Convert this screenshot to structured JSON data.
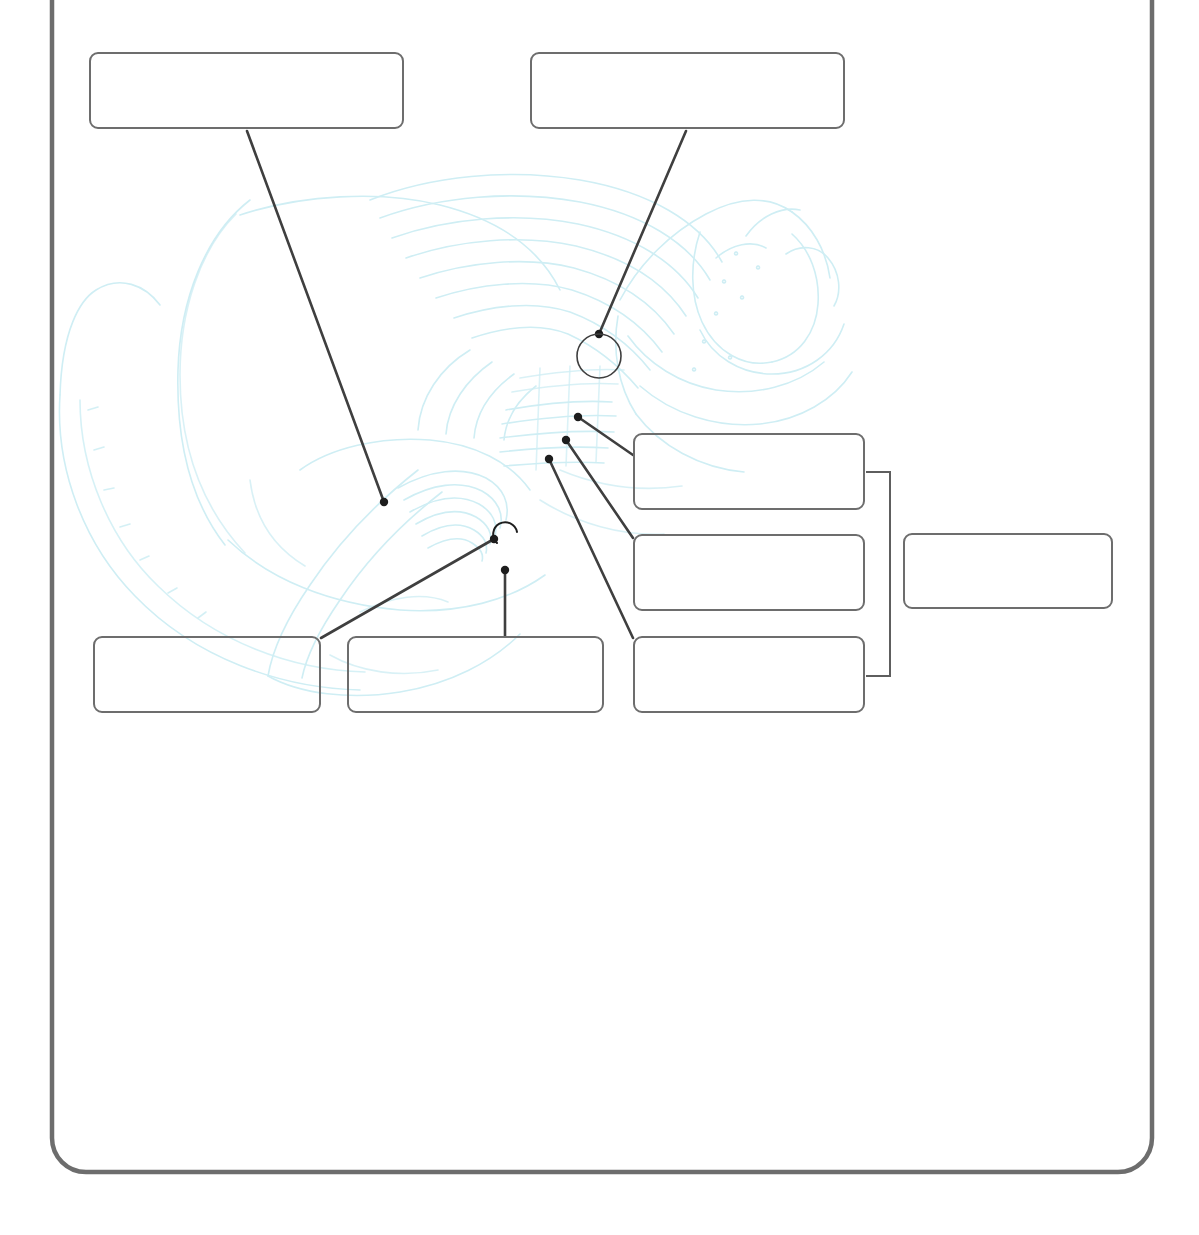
{
  "worksheet": {
    "title": "Anatomy Labeling Worksheet",
    "frame": {
      "name": "page-frame",
      "stroke_color": "#6d6d6d",
      "corner_radius": 34,
      "x": 52,
      "y": -60,
      "width": 1100,
      "height": 1232
    },
    "illustration": {
      "name": "anatomical-line-art",
      "description": "faint cyan anatomical line drawing",
      "stroke_color": "#cdeef2"
    },
    "label_boxes": [
      {
        "id": "box-1",
        "label": "",
        "placeholder": "",
        "x": 89,
        "y": 52,
        "width": 315,
        "height": 77
      },
      {
        "id": "box-2",
        "label": "",
        "placeholder": "",
        "x": 530,
        "y": 52,
        "width": 315,
        "height": 77
      },
      {
        "id": "box-3",
        "label": "",
        "placeholder": "",
        "x": 633,
        "y": 433,
        "width": 232,
        "height": 77
      },
      {
        "id": "box-4",
        "label": "",
        "placeholder": "",
        "x": 633,
        "y": 534,
        "width": 232,
        "height": 77
      },
      {
        "id": "box-5",
        "label": "",
        "placeholder": "",
        "x": 633,
        "y": 636,
        "width": 232,
        "height": 77
      },
      {
        "id": "box-6",
        "label": "",
        "placeholder": "",
        "x": 903,
        "y": 533,
        "width": 210,
        "height": 76
      },
      {
        "id": "box-7",
        "label": "",
        "placeholder": "",
        "x": 93,
        "y": 636,
        "width": 228,
        "height": 77
      },
      {
        "id": "box-8",
        "label": "",
        "placeholder": "",
        "x": 347,
        "y": 636,
        "width": 257,
        "height": 77
      }
    ],
    "leader_lines": [
      {
        "id": "leader-1",
        "from_box": "box-1",
        "x1": 247,
        "y1": 131,
        "x2": 384,
        "y2": 502,
        "endpoint": "dot"
      },
      {
        "id": "leader-2",
        "from_box": "box-2",
        "x1": 686,
        "y1": 131,
        "x2": 599,
        "y2": 334,
        "endpoint": "circle"
      },
      {
        "id": "leader-3",
        "from_box": "box-3",
        "x1": 633,
        "y1": 455,
        "x2": 578,
        "y2": 417,
        "endpoint": "dot"
      },
      {
        "id": "leader-4",
        "from_box": "box-4",
        "x1": 633,
        "y1": 538,
        "x2": 566,
        "y2": 440,
        "endpoint": "dot"
      },
      {
        "id": "leader-5",
        "from_box": "box-5",
        "x1": 633,
        "y1": 638,
        "x2": 549,
        "y2": 459,
        "endpoint": "dot"
      },
      {
        "id": "leader-6",
        "from_box": "box-7",
        "x1": 321,
        "y1": 638,
        "x2": 494,
        "y2": 539,
        "endpoint": "dot"
      },
      {
        "id": "leader-7",
        "from_box": "box-8",
        "x1": 505,
        "y1": 636,
        "x2": 505,
        "y2": 570,
        "endpoint": "dot"
      }
    ],
    "annotations": [
      {
        "id": "callout-circle",
        "name": "callout-circle",
        "cx": 599,
        "cy": 356,
        "r": 22
      },
      {
        "id": "hook-arc",
        "name": "hook-arc-marker",
        "cx": 507,
        "cy": 535,
        "r": 12
      }
    ],
    "bracket": {
      "name": "grouping-bracket",
      "x": 890,
      "y_top": 472,
      "y_bottom": 676,
      "arm": 24,
      "links_boxes": [
        "box-3",
        "box-4",
        "box-5"
      ],
      "to_box": "box-6"
    }
  }
}
